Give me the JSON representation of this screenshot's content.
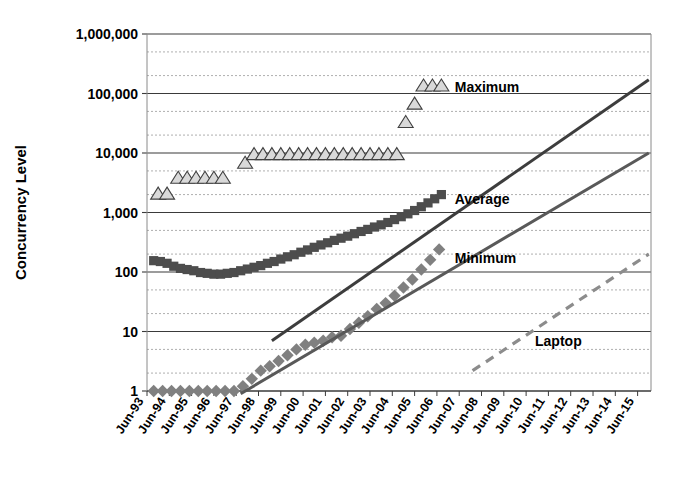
{
  "chart_data": {
    "type": "scatter",
    "title": "",
    "xlabel": "",
    "ylabel": "Concurrency Level",
    "yscale": "log",
    "ylim": [
      1,
      1000000
    ],
    "ytick_labels": [
      "1",
      "10",
      "100",
      "1,000",
      "10,000",
      "100,000",
      "1,000,000"
    ],
    "ytick_values": [
      1,
      10,
      100,
      1000,
      10000,
      100000,
      1000000
    ],
    "grid": "major solid, minor dashed",
    "legend_position": "inline annotations",
    "x_categories": [
      "Jun-93",
      "Jun-94",
      "Jun-95",
      "Jun-96",
      "Jun-97",
      "Jun-98",
      "Jun-99",
      "Jun-00",
      "Jun-01",
      "Jun-02",
      "Jun-03",
      "Jun-04",
      "Jun-05",
      "Jun-06",
      "Jun-07",
      "Jun-08",
      "Jun-09",
      "Jun-10",
      "Jun-11",
      "Jun-12",
      "Jun-13",
      "Jun-14",
      "Jun-15"
    ],
    "xlim": [
      "Jun-93",
      "Jun-15"
    ],
    "series": [
      {
        "name": "Maximum",
        "marker": "triangle",
        "color": "#d9d9d9",
        "edge_color": "#404040",
        "x": [
          1993.5,
          1993.9,
          1994.4,
          1994.8,
          1995.2,
          1995.6,
          1996.0,
          1996.4,
          1997.4,
          1997.8,
          1998.2,
          1998.6,
          1999.0,
          1999.4,
          1999.8,
          2000.2,
          2000.6,
          2001.0,
          2001.4,
          2001.8,
          2002.2,
          2002.6,
          2003.0,
          2003.4,
          2003.8,
          2004.2,
          2004.6,
          2005.0,
          2005.4,
          2005.8,
          2006.2
        ],
        "values": [
          2000,
          2000,
          3700,
          3700,
          3700,
          3700,
          3700,
          3700,
          6600,
          9200,
          9200,
          9200,
          9200,
          9200,
          9200,
          9200,
          9200,
          9200,
          9200,
          9200,
          9200,
          9200,
          9200,
          9200,
          9200,
          9200,
          32000,
          65000,
          131000,
          131000,
          131000
        ]
      },
      {
        "name": "Average",
        "marker": "square",
        "color": "#4d4d4d",
        "x": [
          1993.3,
          1993.6,
          1993.9,
          1994.2,
          1994.5,
          1994.8,
          1995.1,
          1995.4,
          1995.7,
          1996.0,
          1996.3,
          1996.6,
          1996.9,
          1997.2,
          1997.5,
          1997.8,
          1998.1,
          1998.4,
          1998.7,
          1999.0,
          1999.3,
          1999.6,
          1999.9,
          2000.2,
          2000.5,
          2000.8,
          2001.1,
          2001.4,
          2001.7,
          2002.0,
          2002.3,
          2002.6,
          2002.9,
          2003.2,
          2003.5,
          2003.8,
          2004.1,
          2004.4,
          2004.7,
          2005.0,
          2005.3,
          2005.6,
          2005.9,
          2006.2
        ],
        "values": [
          155,
          150,
          140,
          125,
          115,
          110,
          105,
          98,
          95,
          92,
          92,
          95,
          98,
          105,
          112,
          120,
          128,
          140,
          150,
          165,
          180,
          195,
          215,
          235,
          260,
          285,
          310,
          340,
          370,
          400,
          440,
          480,
          520,
          570,
          620,
          680,
          760,
          850,
          950,
          1080,
          1250,
          1450,
          1700,
          2000
        ]
      },
      {
        "name": "Minimum",
        "marker": "diamond",
        "color": "#808080",
        "x": [
          1993.3,
          1993.7,
          1994.1,
          1994.5,
          1994.9,
          1995.3,
          1995.7,
          1996.1,
          1996.5,
          1996.9,
          1997.3,
          1997.7,
          1998.1,
          1998.5,
          1998.9,
          1999.3,
          1999.7,
          2000.1,
          2000.5,
          2000.9,
          2001.3,
          2001.7,
          2002.1,
          2002.5,
          2002.9,
          2003.3,
          2003.7,
          2004.1,
          2004.5,
          2004.9,
          2005.3,
          2005.7,
          2006.1
        ],
        "values": [
          1,
          1,
          1,
          1,
          1,
          1,
          1,
          1,
          1,
          1,
          1.2,
          1.6,
          2.2,
          2.6,
          3.2,
          4,
          5,
          6,
          6.5,
          7,
          8,
          8.5,
          11,
          14,
          18,
          24,
          30,
          40,
          55,
          75,
          110,
          160,
          240
        ]
      },
      {
        "name": "Average trend",
        "marker": "line",
        "style": "solid",
        "color": "#3d3d3d",
        "x": [
          1998.6,
          2015.5
        ],
        "values": [
          7,
          170000
        ]
      },
      {
        "name": "Minimum trend",
        "marker": "line",
        "style": "solid",
        "color": "#595959",
        "x": [
          1997.2,
          2015.5
        ],
        "values": [
          0.9,
          10000
        ]
      },
      {
        "name": "Laptop",
        "marker": "line",
        "style": "dashed",
        "color": "#8c8c8c",
        "x": [
          2007.6,
          2015.5
        ],
        "values": [
          2.2,
          200
        ]
      }
    ],
    "annotations": [
      {
        "text": "Maximum",
        "x": 2006.8,
        "y": 131000
      },
      {
        "text": "Average",
        "x": 2006.8,
        "y": 1700
      },
      {
        "text": "Minimum",
        "x": 2006.8,
        "y": 170
      },
      {
        "text": "Laptop",
        "x": 2010.4,
        "y": 7
      }
    ]
  }
}
